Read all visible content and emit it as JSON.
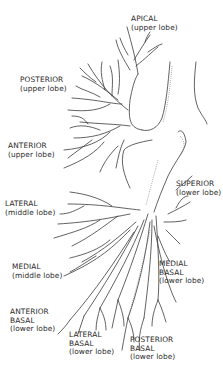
{
  "diagram": {
    "labels": [
      {
        "id": "apical",
        "lines": [
          "APICAL",
          "(upper lobe)"
        ],
        "x": 131,
        "y": 15
      },
      {
        "id": "posterior",
        "lines": [
          "POSTERIOR",
          "(upper lobe)"
        ],
        "x": 20,
        "y": 76
      },
      {
        "id": "anterior",
        "lines": [
          "ANTERIOR",
          "(upper lobe)"
        ],
        "x": 8,
        "y": 142
      },
      {
        "id": "lateral",
        "lines": [
          "LATERAL",
          "(middle lobe)"
        ],
        "x": 5,
        "y": 200
      },
      {
        "id": "superior",
        "lines": [
          "SUPERIOR",
          "(lower lobe)"
        ],
        "x": 176,
        "y": 180
      },
      {
        "id": "medial",
        "lines": [
          "MEDIAL",
          "(middle lobe)"
        ],
        "x": 12,
        "y": 263
      },
      {
        "id": "medial-basal",
        "lines": [
          "MEDIAL",
          "BASAL",
          "(lower lobe)"
        ],
        "x": 159,
        "y": 260
      },
      {
        "id": "anterior-basal",
        "lines": [
          "ANTERIOR",
          "BASAL",
          "(lower lobe)"
        ],
        "x": 10,
        "y": 308
      },
      {
        "id": "lateral-basal",
        "lines": [
          "LATERAL",
          "BASAL",
          "(lower lobe)"
        ],
        "x": 69,
        "y": 331
      },
      {
        "id": "posterior-basal",
        "lines": [
          "POSTERIOR",
          "BASAL",
          "(lower lobe)"
        ],
        "x": 130,
        "y": 336
      }
    ],
    "colors": {
      "line": "#3a3a3a",
      "text": "#2a2a2a",
      "background": "#ffffff"
    }
  }
}
